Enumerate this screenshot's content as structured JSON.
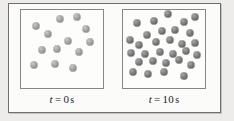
{
  "figure": {
    "type": "particle-diffusion-diagram",
    "frame_color": "#6f6f6f",
    "box_border_color": "#878787",
    "box_fill": "#fdfdfc",
    "background": "#edecea"
  },
  "panels": [
    {
      "id": "panel-initial",
      "caption": {
        "variable": "t",
        "equals": "=",
        "value": "0",
        "unit": "s",
        "full": "t = 0 s"
      },
      "particle_count": 13,
      "particle_shade": "light",
      "particle_color": "#a3a3a3",
      "particles": [
        {
          "x": 18,
          "y": 20
        },
        {
          "x": 47,
          "y": 11
        },
        {
          "x": 68,
          "y": 9
        },
        {
          "x": 33,
          "y": 31
        },
        {
          "x": 79,
          "y": 24
        },
        {
          "x": 57,
          "y": 40
        },
        {
          "x": 26,
          "y": 51
        },
        {
          "x": 44,
          "y": 50
        },
        {
          "x": 71,
          "y": 54
        },
        {
          "x": 16,
          "y": 70
        },
        {
          "x": 41,
          "y": 69
        },
        {
          "x": 64,
          "y": 74
        },
        {
          "x": 84,
          "y": 41
        }
      ]
    },
    {
      "id": "panel-final",
      "caption": {
        "variable": "t",
        "equals": "=",
        "value": "10",
        "unit": "s",
        "full": "t = 10 s"
      },
      "particle_count": 30,
      "particle_shade": "dark",
      "particle_color": "#7d7d7d",
      "particles": [
        {
          "x": 17,
          "y": 17
        },
        {
          "x": 38,
          "y": 14
        },
        {
          "x": 55,
          "y": 5
        },
        {
          "x": 74,
          "y": 16
        },
        {
          "x": 88,
          "y": 9
        },
        {
          "x": 29,
          "y": 32
        },
        {
          "x": 47,
          "y": 27
        },
        {
          "x": 63,
          "y": 25
        },
        {
          "x": 82,
          "y": 30
        },
        {
          "x": 8,
          "y": 38
        },
        {
          "x": 20,
          "y": 45
        },
        {
          "x": 40,
          "y": 41
        },
        {
          "x": 57,
          "y": 38
        },
        {
          "x": 72,
          "y": 44
        },
        {
          "x": 88,
          "y": 42
        },
        {
          "x": 10,
          "y": 55
        },
        {
          "x": 27,
          "y": 57
        },
        {
          "x": 45,
          "y": 54
        },
        {
          "x": 61,
          "y": 56
        },
        {
          "x": 77,
          "y": 52
        },
        {
          "x": 90,
          "y": 58
        },
        {
          "x": 19,
          "y": 67
        },
        {
          "x": 36,
          "y": 66
        },
        {
          "x": 52,
          "y": 68
        },
        {
          "x": 68,
          "y": 64
        },
        {
          "x": 83,
          "y": 70
        },
        {
          "x": 12,
          "y": 79
        },
        {
          "x": 31,
          "y": 82
        },
        {
          "x": 50,
          "y": 80
        },
        {
          "x": 74,
          "y": 84
        }
      ]
    }
  ]
}
